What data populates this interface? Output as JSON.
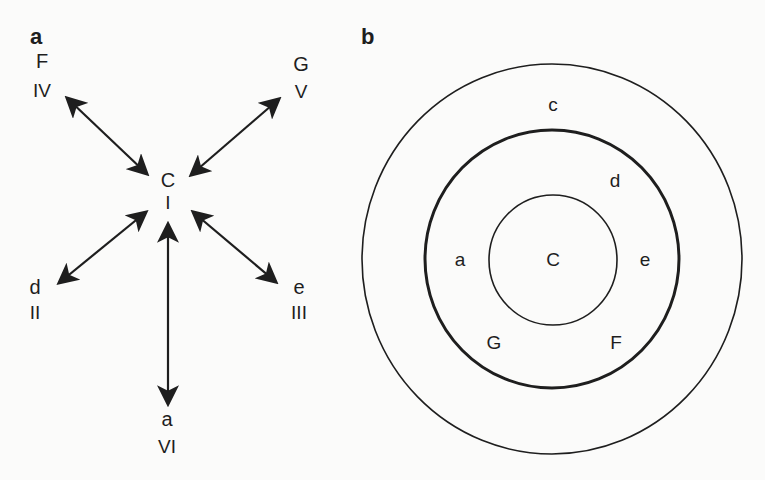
{
  "panel_a": {
    "label": "a",
    "center": {
      "letter": "C",
      "roman": "I"
    },
    "nodes": [
      {
        "id": "F",
        "letter": "F",
        "roman": "IV",
        "position": "top-left"
      },
      {
        "id": "G",
        "letter": "G",
        "roman": "V",
        "position": "top-right"
      },
      {
        "id": "d",
        "letter": "d",
        "roman": "II",
        "position": "bottom-left"
      },
      {
        "id": "e",
        "letter": "e",
        "roman": "III",
        "position": "bottom-right"
      },
      {
        "id": "a",
        "letter": "a",
        "roman": "VI",
        "position": "bottom"
      }
    ],
    "edges": [
      {
        "from": "C",
        "to": "F",
        "type": "bidirectional"
      },
      {
        "from": "C",
        "to": "G",
        "type": "bidirectional"
      },
      {
        "from": "C",
        "to": "d",
        "type": "bidirectional"
      },
      {
        "from": "C",
        "to": "e",
        "type": "bidirectional"
      },
      {
        "from": "C",
        "to": "a",
        "type": "bidirectional"
      }
    ]
  },
  "panel_b": {
    "label": "b",
    "rings": [
      {
        "name": "inner",
        "style": "thin",
        "labels": [
          "C"
        ]
      },
      {
        "name": "middle",
        "style": "thick",
        "labels": [
          "d",
          "a",
          "e",
          "G",
          "F"
        ]
      },
      {
        "name": "outer",
        "style": "thin",
        "labels": [
          "c"
        ]
      }
    ],
    "text": {
      "center": "C",
      "c": "c",
      "d": "d",
      "a": "a",
      "e": "e",
      "G": "G",
      "F": "F"
    }
  },
  "colors": {
    "ink": "#1e1e1e",
    "paper": "#fbfbfa"
  }
}
